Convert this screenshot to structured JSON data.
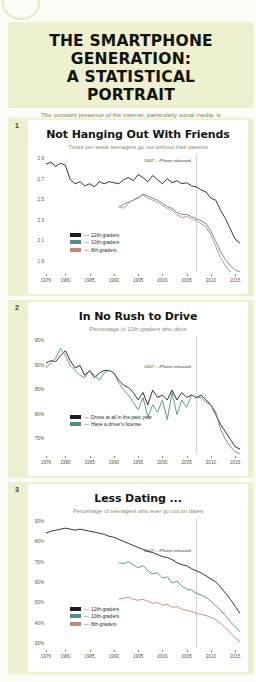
{
  "header": {
    "title_line1": "THE SMARTPHONE GENERATION:",
    "title_line2": "A STATISTICAL PORTRAIT",
    "subtitle": "The constant presence of the internet, particularly social media, is changing the behavior and attitudes of today's teens."
  },
  "colors": {
    "background": "#eef0cf",
    "panel": "#ffffff",
    "series_12th": "#1c1c2b",
    "series_10th": "#4f8f8b",
    "series_8th": "#c08878",
    "series_drove": "#1c1c2b",
    "series_license": "#4f8f8b",
    "annotation_line": "#9a9a86",
    "axis_text": "#56563f"
  },
  "charts": [
    {
      "number": "1",
      "title": "Not Hanging Out With Friends",
      "subtitle": "Times per week teenagers go out without their parents",
      "annotation": "2007 – iPhone released",
      "annotation_year": 2007,
      "legend": [
        {
          "label": "12th-graders",
          "color": "#1c1c2b"
        },
        {
          "label": "10th-graders",
          "color": "#4f8f8b"
        },
        {
          "label": "8th-graders",
          "color": "#c08878"
        }
      ],
      "chart_data": {
        "type": "line",
        "title": "Not Hanging Out With Friends",
        "xlabel": "",
        "ylabel": "Times per week teenagers go out without their parents",
        "xlim": [
          1976,
          2016
        ],
        "ylim": [
          1.8,
          2.95
        ],
        "yticks": [
          "2.9",
          "2.7",
          "2.5",
          "2.3",
          "2.1",
          "1.9"
        ],
        "ytick_values": [
          2.9,
          2.7,
          2.5,
          2.3,
          2.1,
          1.9
        ],
        "xticks": [
          "1976",
          "1980",
          "1985",
          "1990",
          "1995",
          "2000",
          "2005",
          "2010",
          "2015"
        ],
        "xtick_values": [
          1976,
          1980,
          1985,
          1990,
          1995,
          2000,
          2005,
          2010,
          2015
        ],
        "grid": false,
        "legend_position": "bottom-left",
        "series": [
          {
            "name": "12th-graders",
            "color": "#1c1c2b",
            "x": [
              1976,
              1977,
              1978,
              1979,
              1980,
              1981,
              1982,
              1983,
              1984,
              1985,
              1986,
              1987,
              1988,
              1989,
              1990,
              1991,
              1992,
              1993,
              1994,
              1995,
              1996,
              1997,
              1998,
              1999,
              2000,
              2001,
              2002,
              2003,
              2004,
              2005,
              2006,
              2007,
              2008,
              2009,
              2010,
              2011,
              2012,
              2013,
              2014,
              2015,
              2016
            ],
            "values": [
              2.85,
              2.87,
              2.83,
              2.86,
              2.84,
              2.7,
              2.66,
              2.68,
              2.64,
              2.66,
              2.63,
              2.68,
              2.66,
              2.68,
              2.67,
              2.66,
              2.7,
              2.72,
              2.69,
              2.75,
              2.72,
              2.68,
              2.74,
              2.7,
              2.66,
              2.71,
              2.67,
              2.69,
              2.66,
              2.67,
              2.64,
              2.63,
              2.6,
              2.58,
              2.52,
              2.5,
              2.4,
              2.32,
              2.22,
              2.12,
              2.08
            ]
          },
          {
            "name": "10th-graders",
            "color": "#4f8f8b",
            "x": [
              1991,
              1992,
              1993,
              1994,
              1995,
              1996,
              1997,
              1998,
              1999,
              2000,
              2001,
              2002,
              2003,
              2004,
              2005,
              2006,
              2007,
              2008,
              2009,
              2010,
              2011,
              2012,
              2013,
              2014,
              2015,
              2016
            ],
            "values": [
              2.43,
              2.46,
              2.48,
              2.5,
              2.52,
              2.56,
              2.54,
              2.52,
              2.5,
              2.47,
              2.44,
              2.42,
              2.38,
              2.36,
              2.36,
              2.34,
              2.32,
              2.3,
              2.27,
              2.2,
              2.1,
              2.0,
              1.92,
              1.86,
              1.82,
              1.8
            ]
          },
          {
            "name": "8th-graders",
            "color": "#c08878",
            "x": [
              1991,
              1992,
              1993,
              1994,
              1995,
              1996,
              1997,
              1998,
              1999,
              2000,
              2001,
              2002,
              2003,
              2004,
              2005,
              2006,
              2007,
              2008,
              2009,
              2010,
              2011,
              2012,
              2013,
              2014,
              2015,
              2016
            ],
            "values": [
              2.44,
              2.42,
              2.47,
              2.5,
              2.53,
              2.55,
              2.52,
              2.5,
              2.48,
              2.45,
              2.42,
              2.4,
              2.36,
              2.33,
              2.34,
              2.32,
              2.3,
              2.27,
              2.24,
              2.16,
              2.05,
              1.94,
              1.86,
              1.8,
              1.76,
              1.74
            ]
          }
        ]
      }
    },
    {
      "number": "2",
      "title": "In No Rush to Drive",
      "subtitle": "Percentage of 12th-graders who drive",
      "annotation": "2007 – iPhone released",
      "annotation_year": 2007,
      "legend": [
        {
          "label": "Drove at all in the past year",
          "color": "#1c1c2b"
        },
        {
          "label": "Have a driver's license",
          "color": "#4f8f8b"
        }
      ],
      "chart_data": {
        "type": "line",
        "title": "In No Rush to Drive",
        "xlabel": "",
        "ylabel": "Percentage of 12th-graders who drive",
        "xlim": [
          1976,
          2016
        ],
        "ylim": [
          72,
          96
        ],
        "yticks": [
          "95%",
          "90%",
          "85%",
          "80%",
          "75%"
        ],
        "ytick_values": [
          95,
          90,
          85,
          80,
          75
        ],
        "xticks": [
          "1976",
          "1980",
          "1985",
          "1990",
          "1995",
          "2000",
          "2005",
          "2010",
          "2015"
        ],
        "xtick_values": [
          1976,
          1980,
          1985,
          1990,
          1995,
          2000,
          2005,
          2010,
          2015
        ],
        "grid": false,
        "legend_position": "bottom-left",
        "series": [
          {
            "name": "Drove at all in the past year",
            "color": "#1c1c2b",
            "x": [
              1976,
              1977,
              1978,
              1979,
              1980,
              1981,
              1982,
              1983,
              1984,
              1985,
              1986,
              1987,
              1988,
              1989,
              1990,
              1991,
              1992,
              1993,
              1994,
              1995,
              1996,
              1997,
              1998,
              1999,
              2000,
              2001,
              2002,
              2003,
              2004,
              2005,
              2006,
              2007,
              2008,
              2009,
              2010,
              2011,
              2012,
              2013,
              2014,
              2015,
              2016
            ],
            "values": [
              90.5,
              91.0,
              90.8,
              92.0,
              93.0,
              91.0,
              89.5,
              90.0,
              88.0,
              89.0,
              87.5,
              88.5,
              89.0,
              89.0,
              88.5,
              87.0,
              86.0,
              85.5,
              84.5,
              83.0,
              84.5,
              82.0,
              85.0,
              83.5,
              84.0,
              83.0,
              85.0,
              83.0,
              84.5,
              83.5,
              84.0,
              83.5,
              84.0,
              83.0,
              82.0,
              80.0,
              78.0,
              76.5,
              75.0,
              73.5,
              73.0
            ]
          },
          {
            "name": "Have a driver's license",
            "color": "#4f8f8b",
            "x": [
              1976,
              1977,
              1978,
              1979,
              1980,
              1981,
              1982,
              1983,
              1984,
              1985,
              1986,
              1987,
              1988,
              1989,
              1990,
              1991,
              1992,
              1993,
              1994,
              1995,
              1996,
              1997,
              1998,
              1999,
              2000,
              2001,
              2002,
              2003,
              2004,
              2005,
              2006,
              2007,
              2008,
              2009,
              2010,
              2011,
              2012,
              2013,
              2014,
              2015,
              2016
            ],
            "values": [
              89.5,
              90.5,
              91.5,
              93.5,
              92.0,
              90.0,
              89.0,
              88.0,
              87.5,
              89.0,
              88.0,
              87.0,
              88.5,
              89.0,
              88.5,
              86.5,
              85.0,
              84.0,
              82.5,
              81.0,
              83.5,
              79.5,
              82.0,
              80.5,
              83.0,
              79.0,
              84.5,
              80.0,
              83.0,
              81.5,
              84.0,
              83.5,
              83.5,
              82.5,
              82.0,
              80.5,
              77.0,
              75.0,
              73.5,
              72.5,
              72.0
            ]
          }
        ]
      }
    },
    {
      "number": "3",
      "title": "Less Dating ...",
      "subtitle": "Percentage of teenagers who ever go out on dates",
      "annotation": "2007 – iPhone released",
      "annotation_year": 2007,
      "legend": [
        {
          "label": "12th-graders",
          "color": "#1c1c2b"
        },
        {
          "label": "10th-graders",
          "color": "#4f8f8b"
        },
        {
          "label": "8th-graders",
          "color": "#c08878"
        }
      ],
      "chart_data": {
        "type": "line",
        "title": "Less Dating ...",
        "xlabel": "",
        "ylabel": "Percentage of teenagers who ever go out on dates",
        "xlim": [
          1976,
          2016
        ],
        "ylim": [
          28,
          92
        ],
        "yticks": [
          "90%",
          "80%",
          "70%",
          "60%",
          "50%",
          "40%",
          "30%"
        ],
        "ytick_values": [
          90,
          80,
          70,
          60,
          50,
          40,
          30
        ],
        "xticks": [
          "1976",
          "1980",
          "1985",
          "1990",
          "1995",
          "2000",
          "2005",
          "2010",
          "2015"
        ],
        "xtick_values": [
          1976,
          1980,
          1985,
          1990,
          1995,
          2000,
          2005,
          2010,
          2015
        ],
        "grid": false,
        "legend_position": "bottom-left",
        "series": [
          {
            "name": "12th-graders",
            "color": "#1c1c2b",
            "x": [
              1976,
              1977,
              1978,
              1979,
              1980,
              1981,
              1982,
              1983,
              1984,
              1985,
              1986,
              1987,
              1988,
              1989,
              1990,
              1991,
              1992,
              1993,
              1994,
              1995,
              1996,
              1997,
              1998,
              1999,
              2000,
              2001,
              2002,
              2003,
              2004,
              2005,
              2006,
              2007,
              2008,
              2009,
              2010,
              2011,
              2012,
              2013,
              2014,
              2015,
              2016
            ],
            "values": [
              84.5,
              85.5,
              86.0,
              86.5,
              87.0,
              86.5,
              86.0,
              86.5,
              86.0,
              85.5,
              85.0,
              84.5,
              84.0,
              83.0,
              82.5,
              81.5,
              80.5,
              79.5,
              78.5,
              77.5,
              76.5,
              75.5,
              75.0,
              74.0,
              73.0,
              72.5,
              71.5,
              70.0,
              69.0,
              68.5,
              67.0,
              66.0,
              65.0,
              63.5,
              62.0,
              60.5,
              58.0,
              55.0,
              52.0,
              48.5,
              45.0
            ]
          },
          {
            "name": "10th-graders",
            "color": "#4f8f8b",
            "x": [
              1991,
              1992,
              1993,
              1994,
              1995,
              1996,
              1997,
              1998,
              1999,
              2000,
              2001,
              2002,
              2003,
              2004,
              2005,
              2006,
              2007,
              2008,
              2009,
              2010,
              2011,
              2012,
              2013,
              2014,
              2015,
              2016
            ],
            "values": [
              70.0,
              69.5,
              70.5,
              69.0,
              67.5,
              68.5,
              66.0,
              64.5,
              65.0,
              62.5,
              63.0,
              60.0,
              61.0,
              58.5,
              57.0,
              56.5,
              55.0,
              54.0,
              53.0,
              51.0,
              49.0,
              46.5,
              44.0,
              41.0,
              38.5,
              36.0
            ]
          },
          {
            "name": "8th-graders",
            "color": "#c08878",
            "x": [
              1991,
              1992,
              1993,
              1994,
              1995,
              1996,
              1997,
              1998,
              1999,
              2000,
              2001,
              2002,
              2003,
              2004,
              2005,
              2006,
              2007,
              2008,
              2009,
              2010,
              2011,
              2012,
              2013,
              2014,
              2015,
              2016
            ],
            "values": [
              52.0,
              52.5,
              53.0,
              52.0,
              51.5,
              52.0,
              51.0,
              50.0,
              50.5,
              49.0,
              49.5,
              48.0,
              48.5,
              47.0,
              46.5,
              46.0,
              45.0,
              44.5,
              44.0,
              43.0,
              42.0,
              40.0,
              38.0,
              35.5,
              33.0,
              31.0
            ]
          }
        ]
      }
    }
  ]
}
